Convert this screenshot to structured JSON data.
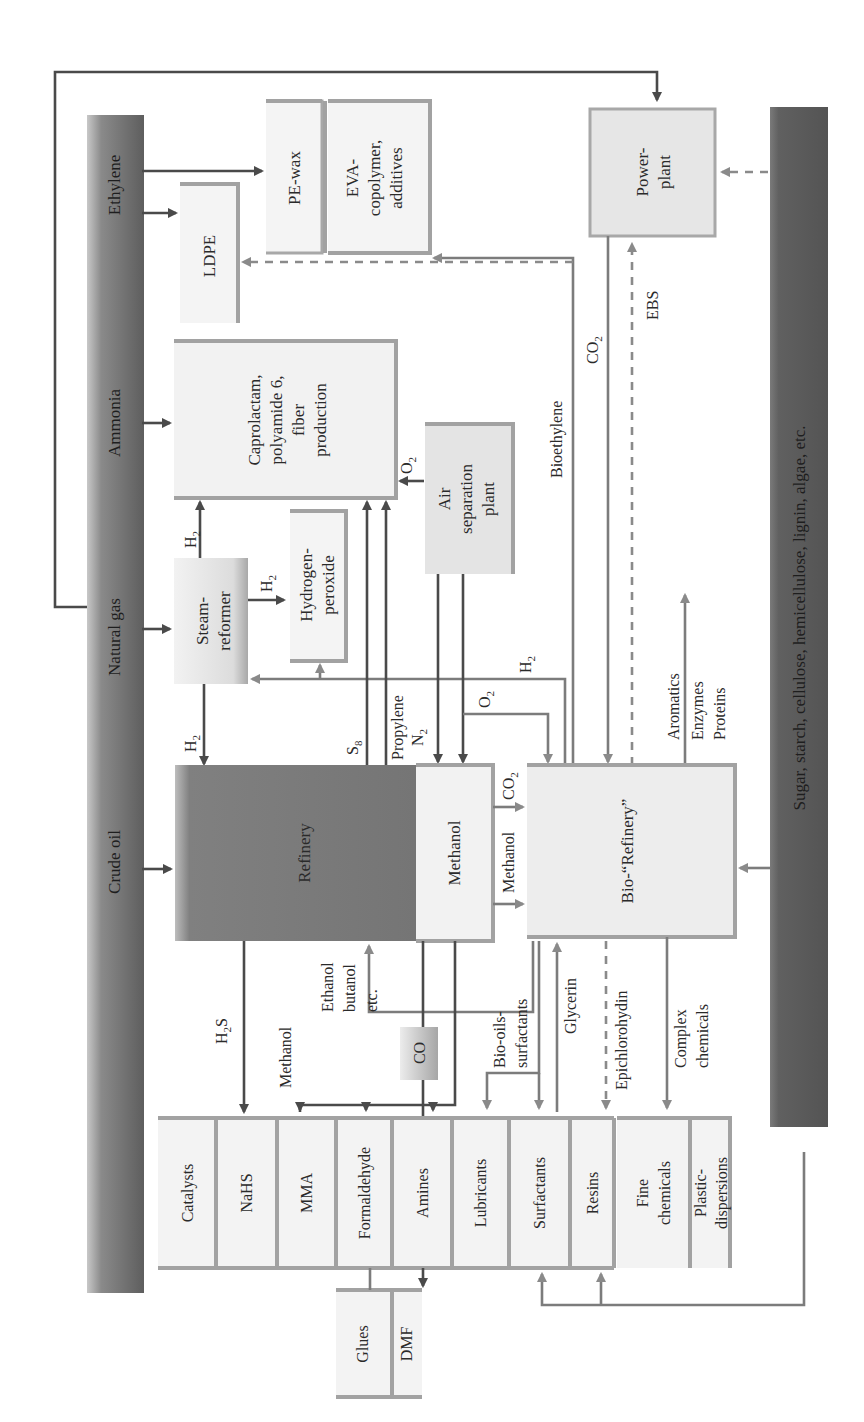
{
  "diagram": {
    "orientation": "rotated-90-ccw",
    "feedstock_bars": {
      "fossil": {
        "segments": [
          "Ethylene",
          "Ammonia",
          "Natural gas",
          "Crude oil"
        ]
      },
      "renewable": {
        "label": "Sugar, starch, cellulose, hemicellulose, lignin, algae, etc."
      }
    },
    "units": {
      "pe_wax": "PE-wax",
      "eva": [
        "EVA-",
        "copolymer,",
        "additives"
      ],
      "ldpe": "LDPE",
      "caprolactam": [
        "Caprolactam,",
        "polyamide 6,",
        "fiber",
        "production"
      ],
      "steam_reformer": [
        "Steam-",
        "reformer"
      ],
      "hydrogen_peroxide": [
        "Hydrogen-",
        "peroxide"
      ],
      "air_separation": [
        "Air",
        "separation",
        "plant"
      ],
      "refinery": "Refinery",
      "methanol": "Methanol",
      "bio_refinery": "Bio-“Refinery”",
      "power_plant": [
        "Power-",
        "plant"
      ],
      "co": "CO"
    },
    "products": {
      "row1": [
        "Catalysts",
        "NaHS",
        "MMA",
        "Formaldehyde",
        "Amines",
        "Lubricants",
        "Surfactants",
        "Resins"
      ],
      "row1b": [
        [
          "Fine",
          "chemicals"
        ],
        [
          "Plastic-",
          "dispersions"
        ]
      ],
      "row2": [
        "Glues",
        "DMF"
      ]
    },
    "flow_labels": {
      "h2_refinery": "H",
      "h2_caprolactam": "H",
      "h2_peroxide": "H",
      "h2_return": "H",
      "o2_caprolactam": "O",
      "o2_bio": "O",
      "s8": "S",
      "propylene": "Propylene",
      "n2": "N",
      "co2_methanol": "CO",
      "methanol_to_bio": "Methanol",
      "bioethylene": "Bioethylene",
      "co2_power": "CO",
      "ebs": "EBS",
      "aromatics": "Aromatics",
      "enzymes": "Enzymes",
      "proteins": "Proteins",
      "h2s": "H",
      "methanol_products": "Methanol",
      "ethanol": [
        "Ethanol",
        "butanol",
        "etc."
      ],
      "biooils": [
        "Bio-oils-",
        "surfactants"
      ],
      "glycerin": "Glycerin",
      "epichlorohydrin": "Epichlorohydin",
      "complex": [
        "Complex",
        "chemicals"
      ]
    },
    "subscripts": {
      "two": "2",
      "eight": "8",
      "h2s_sub": "2",
      "h2s_tail": "S"
    },
    "colors": {
      "fossil_bar": "#6e6e6e",
      "renewable_bar": "#5a5a5a",
      "refinery_fill": "#7d7d7d",
      "light_box": "#efefef",
      "dark_line": "#4a4a4a",
      "mid_line": "#7c7c7c"
    }
  }
}
